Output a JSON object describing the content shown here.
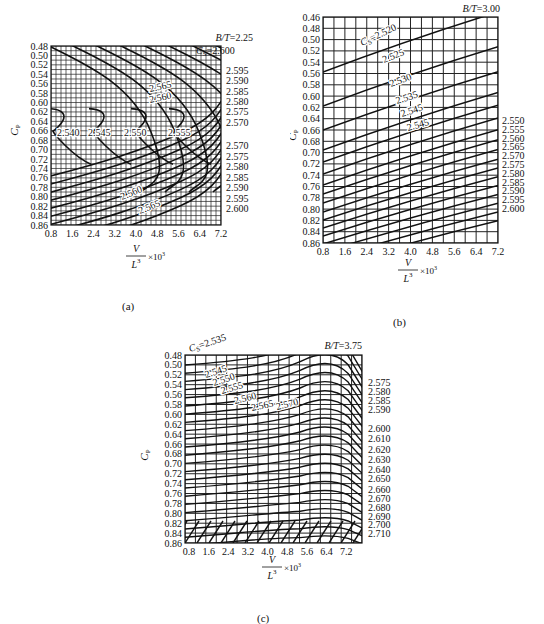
{
  "figure": {
    "panels": [
      {
        "id": "a",
        "caption": "(a)",
        "bt_label": "B/T=2.25"
      },
      {
        "id": "b",
        "caption": "(b)",
        "bt_label": "B/T=3.00"
      },
      {
        "id": "c",
        "caption": "(c)",
        "bt_label": "B/T=3.75"
      }
    ],
    "ylabel": "C_P",
    "xlabel_num": "V",
    "xlabel_den": "L^3",
    "xlabel_mult": "×10^3"
  },
  "chart_data": [
    {
      "type": "contour",
      "panel": "a",
      "title": "B/T=2.25",
      "xlabel": "V/L^3 ×10^3",
      "ylabel": "C_P",
      "x_ticks": [
        "0.8",
        "1.6",
        "2.4",
        "3.2",
        "4.0",
        "4.8",
        "5.6",
        "6.4",
        "7.2"
      ],
      "y_ticks": [
        "0.48",
        "0.50",
        "0.52",
        "0.54",
        "0.56",
        "0.58",
        "0.60",
        "0.62",
        "0.64",
        "0.66",
        "0.68",
        "0.70",
        "0.72",
        "0.74",
        "0.76",
        "0.78",
        "0.80",
        "0.82",
        "0.84",
        "0.86"
      ],
      "xlim": [
        0.8,
        7.2
      ],
      "ylim": [
        0.86,
        0.48
      ],
      "grid": "fine",
      "inline_labels": [
        "2.540",
        "2.545",
        "2.550",
        "2.555",
        "2.560",
        "2.565",
        "2.560",
        "2.565"
      ],
      "right_labels_top": [
        "C_S=2.600",
        "2.595",
        "2.590",
        "2.585",
        "2.580",
        "2.575",
        "2.570"
      ],
      "right_labels_bottom": [
        "2.570",
        "2.575",
        "2.580",
        "2.585",
        "2.590",
        "2.595",
        "2.600"
      ],
      "contour_parameter": "C_S",
      "contour_values": [
        2.54,
        2.545,
        2.55,
        2.555,
        2.56,
        2.565,
        2.57,
        2.575,
        2.58,
        2.585,
        2.59,
        2.595,
        2.6
      ]
    },
    {
      "type": "contour",
      "panel": "b",
      "title": "B/T=3.00",
      "xlabel": "V/L^3 ×10^3",
      "ylabel": "C_P",
      "x_ticks": [
        "0.8",
        "1.6",
        "2.4",
        "3.2",
        "4.0",
        "4.8",
        "5.6",
        "6.4",
        "7.2"
      ],
      "y_ticks": [
        "0.46",
        "0.48",
        "0.50",
        "0.52",
        "0.54",
        "0.56",
        "0.58",
        "0.60",
        "0.62",
        "0.64",
        "0.66",
        "0.68",
        "0.70",
        "0.72",
        "0.74",
        "0.76",
        "0.78",
        "0.80",
        "0.82",
        "0.84",
        "0.86"
      ],
      "xlim": [
        0.8,
        7.2
      ],
      "ylim": [
        0.86,
        0.46
      ],
      "grid": "coarse",
      "inline_labels": [
        "C_S=2.520",
        "2.525",
        "2.530",
        "2.535",
        "2.545",
        "2.545"
      ],
      "right_labels": [
        "2.550",
        "2.555",
        "2.560",
        "2.565",
        "2.570",
        "2.575",
        "2.580",
        "2.585",
        "2.590",
        "2.595",
        "2.600"
      ],
      "contour_parameter": "C_S",
      "contour_values": [
        2.52,
        2.525,
        2.53,
        2.535,
        2.54,
        2.545,
        2.55,
        2.555,
        2.56,
        2.565,
        2.57,
        2.575,
        2.58,
        2.585,
        2.59,
        2.595,
        2.6
      ]
    },
    {
      "type": "contour",
      "panel": "c",
      "title": "B/T=3.75",
      "xlabel": "V/L^3 ×10^3",
      "ylabel": "C_P",
      "x_ticks": [
        "0.8",
        "1.6",
        "2.4",
        "3.2",
        "4.0",
        "4.8",
        "5.6",
        "6.4",
        "7.2"
      ],
      "y_ticks": [
        "0.48",
        "0.50",
        "0.52",
        "0.54",
        "0.56",
        "0.58",
        "0.60",
        "0.62",
        "0.64",
        "0.66",
        "0.68",
        "0.70",
        "0.72",
        "0.74",
        "0.76",
        "0.78",
        "0.80",
        "0.82",
        "0.84",
        "0.86"
      ],
      "xlim": [
        0.8,
        7.6
      ],
      "ylim": [
        0.86,
        0.48
      ],
      "grid": "coarse",
      "inline_labels": [
        "C_S=2.535",
        "2.545",
        "2.550",
        "2.555",
        "2.560",
        "2.565",
        "2.570"
      ],
      "right_labels": [
        "2.575",
        "2.580",
        "2.585",
        "2.590",
        "2.600",
        "2.610",
        "2.620",
        "2.630",
        "2.640",
        "2.650",
        "2.660",
        "2.670",
        "2.680",
        "2.690",
        "2.700",
        "2.710"
      ],
      "contour_parameter": "C_S",
      "contour_values": [
        2.535,
        2.545,
        2.55,
        2.555,
        2.56,
        2.565,
        2.57,
        2.575,
        2.58,
        2.585,
        2.59,
        2.6,
        2.61,
        2.62,
        2.63,
        2.64,
        2.65,
        2.66,
        2.67,
        2.68,
        2.69,
        2.7,
        2.71
      ]
    }
  ]
}
